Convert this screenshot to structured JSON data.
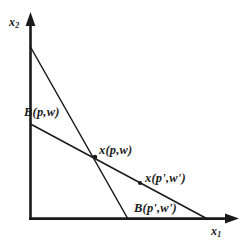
{
  "figure": {
    "background_color": "#ffffff",
    "line_color": "#1a1a1a",
    "axes": {
      "x_axis": {
        "name": "x1-axis",
        "label": "x",
        "subscript": "1",
        "origin": {
          "x": 30,
          "y": 219
        },
        "end": {
          "x": 238,
          "y": 219
        },
        "arrow": "right"
      },
      "y_axis": {
        "name": "x2-axis",
        "label": "x",
        "subscript": "2",
        "origin": {
          "x": 30,
          "y": 219
        },
        "end": {
          "x": 30,
          "y": 13
        },
        "arrow": "up"
      }
    },
    "budget_lines": [
      {
        "id": "budget-line-steep",
        "label": "B(p,w)",
        "from": {
          "x": 30,
          "y": 47
        },
        "to": {
          "x": 128,
          "y": 219
        }
      },
      {
        "id": "budget-line-shallow",
        "label": "B(p',w')",
        "from": {
          "x": 31,
          "y": 124
        },
        "to": {
          "x": 207,
          "y": 219
        }
      }
    ],
    "points": [
      {
        "id": "demand-point-pw",
        "label": "x(p,w)",
        "x": 95,
        "y": 157
      },
      {
        "id": "demand-point-ppwp",
        "label": "x(p',w')",
        "x": 140,
        "y": 183
      }
    ]
  }
}
